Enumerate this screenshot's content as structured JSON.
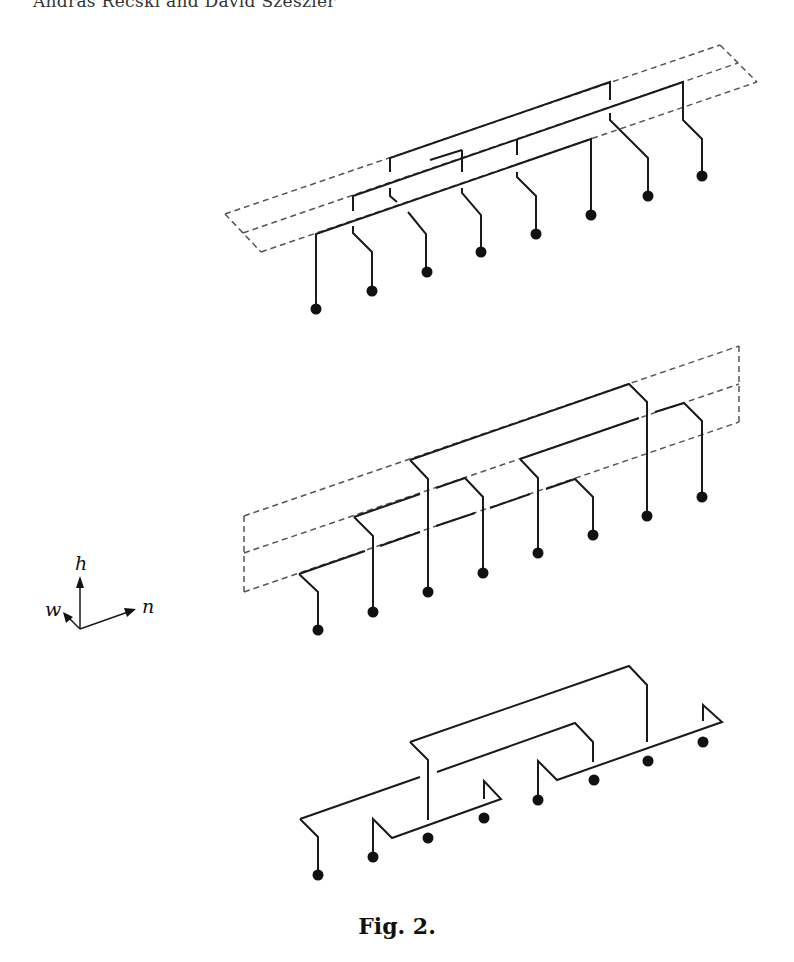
{
  "header": {
    "running_head": "András Recski and David Szeszlér"
  },
  "caption": "Fig. 2.",
  "axes": {
    "labels": {
      "up": "h",
      "left_back": "w",
      "right": "n"
    }
  },
  "figures": [
    {
      "name": "top-layout",
      "description": "Three parallel wire layers inside dashed slanted box, 8 pins",
      "pins": 8
    },
    {
      "name": "middle-layout",
      "description": "Two-level wiring inside dashed vertical box, 8 pins",
      "pins": 8
    },
    {
      "name": "bottom-layout",
      "description": "Wiring without bounding box, 8 pins",
      "pins": 8
    }
  ]
}
